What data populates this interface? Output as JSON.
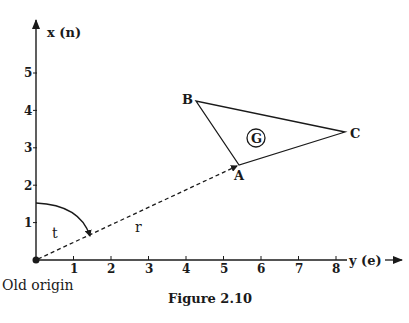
{
  "figure": {
    "caption": "Figure 2.10",
    "axes": {
      "vertical": {
        "label": "x (n)",
        "ticks": [
          "1",
          "2",
          "3",
          "4",
          "5"
        ]
      },
      "horizontal": {
        "label": "y (e)",
        "ticks": [
          "1",
          "2",
          "3",
          "4",
          "5",
          "6",
          "7",
          "8"
        ]
      }
    },
    "origin_label": "Old origin",
    "angle_label": "t",
    "radius_label": "r",
    "triangle": {
      "vertices": [
        {
          "name": "A",
          "e": 5.5,
          "n": 2.55
        },
        {
          "name": "B",
          "e": 4.3,
          "n": 4.25
        },
        {
          "name": "C",
          "e": 8.25,
          "n": 3.42
        }
      ],
      "centroid_label": "G"
    },
    "colors": {
      "ink": "#1a1a1a",
      "background": "#ffffff"
    }
  }
}
